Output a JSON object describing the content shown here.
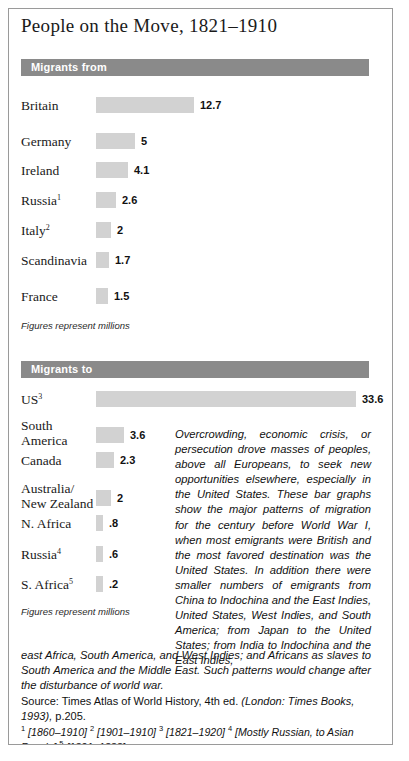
{
  "document": {
    "title": "People on the Move, 1821–1910"
  },
  "chart_data": [
    {
      "type": "bar",
      "title": "Migrants from",
      "orientation": "horizontal",
      "unit_caption": "Figures represent millions",
      "xlabel": "",
      "ylabel": "",
      "xlim": [
        0,
        33.6
      ],
      "grid": false,
      "legend": "none",
      "categories": [
        "Britain",
        "Germany",
        "Ireland",
        "Russia",
        "Italy",
        "Scandinavia",
        "France"
      ],
      "values": [
        12.7,
        5,
        4.1,
        2.6,
        2,
        1.7,
        1.5
      ],
      "value_labels": [
        "12.7",
        "5",
        "4.1",
        "2.6",
        "2",
        "1.7",
        "1.5"
      ],
      "footnote_markers": [
        "",
        "",
        "",
        "1",
        "2",
        "",
        ""
      ]
    },
    {
      "type": "bar",
      "title": "Migrants to",
      "orientation": "horizontal",
      "unit_caption": "Figures represent millions",
      "xlabel": "",
      "ylabel": "",
      "xlim": [
        0,
        33.6
      ],
      "grid": false,
      "legend": "none",
      "categories": [
        "US",
        "South America",
        "Canada",
        "Australia/ New Zealand",
        "N. Africa",
        "Russia",
        "S. Africa"
      ],
      "values": [
        33.6,
        3.6,
        2.3,
        2,
        0.8,
        0.6,
        0.2
      ],
      "value_labels": [
        "33.6",
        "3.6",
        "2.3",
        "2",
        ".8",
        ".6",
        ".2"
      ],
      "footnote_markers": [
        "3",
        "",
        "",
        "",
        "",
        "4",
        "5"
      ]
    }
  ],
  "sections": {
    "from": {
      "band_label": "Migrants from",
      "caption": "Figures represent millions",
      "rows": [
        {
          "label": "Britain",
          "marker": "",
          "value": "12.7",
          "amount": 12.7
        },
        {
          "label": "Germany",
          "marker": "",
          "value": "5",
          "amount": 5
        },
        {
          "label": "Ireland",
          "marker": "",
          "value": "4.1",
          "amount": 4.1
        },
        {
          "label": "Russia",
          "marker": "1",
          "value": "2.6",
          "amount": 2.6
        },
        {
          "label": "Italy",
          "marker": "2",
          "value": "2",
          "amount": 2
        },
        {
          "label": "Scandinavia",
          "marker": "",
          "value": "1.7",
          "amount": 1.7
        },
        {
          "label": "France",
          "marker": "",
          "value": "1.5",
          "amount": 1.5
        }
      ]
    },
    "to": {
      "band_label": "Migrants to",
      "caption": "Figures represent millions",
      "rows": [
        {
          "label": "US",
          "label2": "",
          "marker": "3",
          "value": "33.6",
          "amount": 33.6
        },
        {
          "label": "South",
          "label2": "America",
          "marker": "",
          "value": "3.6",
          "amount": 3.6
        },
        {
          "label": "Canada",
          "label2": "",
          "marker": "",
          "value": "2.3",
          "amount": 2.3
        },
        {
          "label": "Australia/",
          "label2": "New Zealand",
          "marker": "",
          "value": "2",
          "amount": 2
        },
        {
          "label": "N. Africa",
          "label2": "",
          "marker": "",
          "value": ".8",
          "amount": 0.8
        },
        {
          "label": "Russia",
          "label2": "",
          "marker": "4",
          "value": ".6",
          "amount": 0.6
        },
        {
          "label": "S. Africa",
          "label2": "",
          "marker": "5",
          "value": ".2",
          "amount": 0.2
        }
      ]
    }
  },
  "narrative": {
    "column": "Overcrowding, economic crisis, or persecution drove masses of peoples, above all Europeans, to seek new opportunities elsewhere, especially in the United States. These bar graphs show the major patterns of migration for the century before World War I, when most emigrants were British and the most favored destination was the United States. In addition there were smaller numbers of emigrants from China to Indochina and the East Indies, United States, West Indies, and South America; from Japan to the United States; from India to Indochina and the East Indies,",
    "full": "east Africa, South America, and West Indies; and Africans as slaves to South America and the Middle East. Such patterns would change after the disturbance of world war."
  },
  "source": {
    "prefix": "Source: Times Atlas of World History, 4th ed. ",
    "italic": "(London: Times Books, 1993),",
    "suffix": " p.205."
  },
  "footnotes": {
    "items": [
      {
        "marker": "1",
        "text": "[1860–1910]"
      },
      {
        "marker": "2",
        "text": "[1901–1910]"
      },
      {
        "marker": "3",
        "text": "[1821–1920]"
      },
      {
        "marker": "4",
        "text": "[Mostly Russian, to Asian Russia]"
      },
      {
        "marker": "5",
        "text": "[1821–1888]"
      }
    ]
  },
  "style": {
    "band_color": "#8a8a8a",
    "bar_color": "#d2d2d2",
    "text_color": "#111111",
    "border_color": "#9a9a9a"
  }
}
